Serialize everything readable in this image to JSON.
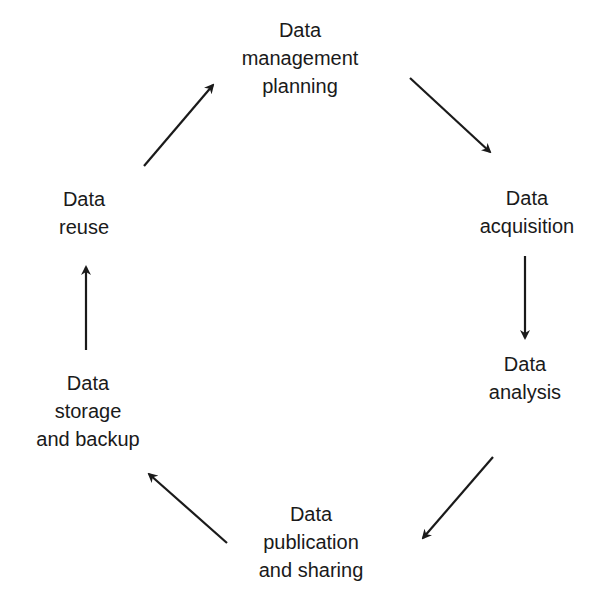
{
  "diagram": {
    "type": "cycle",
    "stroke_color": "#1a1a1a",
    "background": "#ffffff",
    "nodes": [
      {
        "id": "planning",
        "lines": [
          "Data",
          "management",
          "planning"
        ]
      },
      {
        "id": "acquisition",
        "lines": [
          "Data",
          "acquisition"
        ]
      },
      {
        "id": "analysis",
        "lines": [
          "Data",
          "analysis"
        ]
      },
      {
        "id": "publication",
        "lines": [
          "Data",
          "publication",
          "and sharing"
        ]
      },
      {
        "id": "storage",
        "lines": [
          "Data",
          "storage",
          "and backup"
        ]
      },
      {
        "id": "reuse",
        "lines": [
          "Data",
          "reuse"
        ]
      }
    ],
    "edges": [
      {
        "from": "planning",
        "to": "acquisition"
      },
      {
        "from": "acquisition",
        "to": "analysis"
      },
      {
        "from": "analysis",
        "to": "publication"
      },
      {
        "from": "publication",
        "to": "storage"
      },
      {
        "from": "storage",
        "to": "reuse"
      },
      {
        "from": "reuse",
        "to": "planning"
      }
    ]
  }
}
